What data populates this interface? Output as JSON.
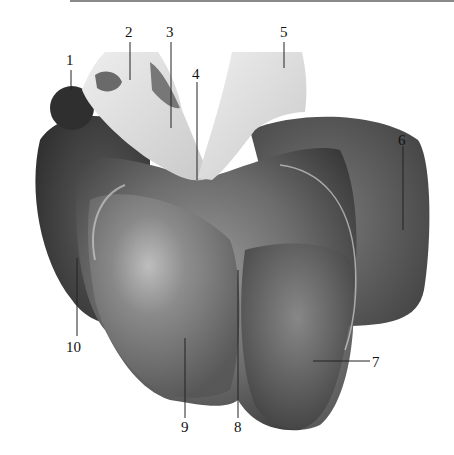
{
  "figure": {
    "labels": [
      {
        "id": "1",
        "text": "1",
        "x": 70,
        "y": 65,
        "lx1": 71,
        "ly1": 70,
        "lx2": 71,
        "ly2": 90
      },
      {
        "id": "2",
        "text": "2",
        "x": 129,
        "y": 37,
        "lx1": 130,
        "ly1": 42,
        "lx2": 130,
        "ly2": 80
      },
      {
        "id": "3",
        "text": "3",
        "x": 170,
        "y": 37,
        "lx1": 171,
        "ly1": 42,
        "lx2": 171,
        "ly2": 128
      },
      {
        "id": "4",
        "text": "4",
        "x": 196,
        "y": 77,
        "lx1": 197,
        "ly1": 82,
        "lx2": 197,
        "ly2": 180
      },
      {
        "id": "5",
        "text": "5",
        "x": 284,
        "y": 37,
        "lx1": 284,
        "ly1": 42,
        "lx2": 284,
        "ly2": 68
      },
      {
        "id": "6",
        "text": "6",
        "x": 402,
        "y": 140,
        "lx1": 403,
        "ly1": 146,
        "lx2": 403,
        "ly2": 230
      },
      {
        "id": "7",
        "text": "7",
        "x": 377,
        "y": 367,
        "lx1": 313,
        "ly1": 361,
        "lx2": 370,
        "ly2": 361
      },
      {
        "id": "8",
        "text": "8",
        "x": 238,
        "y": 432,
        "lx1": 238,
        "ly1": 270,
        "lx2": 238,
        "ly2": 418
      },
      {
        "id": "9",
        "text": "9",
        "x": 185,
        "y": 432,
        "lx1": 185,
        "ly1": 338,
        "lx2": 185,
        "ly2": 418
      },
      {
        "id": "10",
        "text": "10",
        "x": 74,
        "y": 352,
        "lx1": 77,
        "ly1": 258,
        "lx2": 77,
        "ly2": 336
      }
    ]
  }
}
